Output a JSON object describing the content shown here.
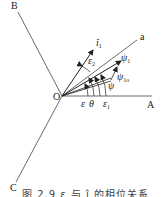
{
  "diagram": {
    "axes": {
      "A": "A",
      "B": "B",
      "C": "C",
      "a": "a",
      "origin": "O"
    },
    "vectors": {
      "i1": {
        "symbol": "î",
        "sub": "1"
      },
      "psi1": {
        "symbol": "ψ",
        "sub": "1"
      },
      "psi1o": {
        "symbol": "ψ",
        "sub": "1o"
      },
      "psi": {
        "symbol": "ψ",
        "sub": ""
      }
    },
    "angles": {
      "eps2": {
        "symbol": "ε",
        "sub": "2"
      },
      "eps": {
        "symbol": "ε",
        "sub": ""
      },
      "theta": {
        "symbol": "θ",
        "sub": ""
      },
      "eps1": {
        "symbol": "ε",
        "sub": "1"
      }
    },
    "caption": "图 2.9   ε 与 î 的相位关系"
  }
}
